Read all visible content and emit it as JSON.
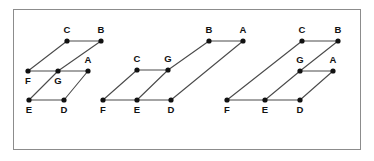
{
  "figure": {
    "domain": "Diagram",
    "canvas": {
      "width": 374,
      "height": 161,
      "background": "#ffffff"
    },
    "frame": {
      "x": 13,
      "y": 9,
      "width": 348,
      "height": 141,
      "stroke": "#8c8c8c",
      "stroke_width": 1
    },
    "style": {
      "edge_color": "#4a4a4a",
      "edge_width": 1.1,
      "node_color": "#111111",
      "node_radius": 2.6,
      "label_color": "#111111",
      "label_size": 9.5
    }
  },
  "graphs": [
    {
      "id": "graph-1",
      "name": "left-graph",
      "nodes": [
        {
          "id": "C",
          "label": "C",
          "x": 67,
          "y": 41,
          "lx": 67,
          "ly": 33
        },
        {
          "id": "B",
          "label": "B",
          "x": 101,
          "y": 41,
          "lx": 101,
          "ly": 33
        },
        {
          "id": "F",
          "label": "F",
          "x": 28,
          "y": 71,
          "lx": 28,
          "ly": 84
        },
        {
          "id": "G",
          "label": "G",
          "x": 58,
          "y": 71,
          "lx": 58,
          "ly": 84
        },
        {
          "id": "A",
          "label": "A",
          "x": 88,
          "y": 71,
          "lx": 88,
          "ly": 63
        },
        {
          "id": "E",
          "label": "E",
          "x": 29,
          "y": 100,
          "lx": 29,
          "ly": 113
        },
        {
          "id": "D",
          "label": "D",
          "x": 64,
          "y": 100,
          "lx": 64,
          "ly": 113
        }
      ],
      "edges": [
        {
          "from": "C",
          "to": "B"
        },
        {
          "from": "F",
          "to": "G"
        },
        {
          "from": "G",
          "to": "A"
        },
        {
          "from": "E",
          "to": "D"
        },
        {
          "from": "F",
          "to": "C"
        },
        {
          "from": "G",
          "to": "B"
        },
        {
          "from": "E",
          "to": "G"
        },
        {
          "from": "D",
          "to": "A"
        }
      ]
    },
    {
      "id": "graph-2",
      "name": "middle-graph",
      "nodes": [
        {
          "id": "B",
          "label": "B",
          "x": 209,
          "y": 41,
          "lx": 209,
          "ly": 33
        },
        {
          "id": "A",
          "label": "A",
          "x": 243,
          "y": 41,
          "lx": 243,
          "ly": 33
        },
        {
          "id": "C",
          "label": "C",
          "x": 137,
          "y": 70,
          "lx": 137,
          "ly": 62
        },
        {
          "id": "G",
          "label": "G",
          "x": 168,
          "y": 70,
          "lx": 168,
          "ly": 62
        },
        {
          "id": "F",
          "label": "F",
          "x": 103,
          "y": 100,
          "lx": 103,
          "ly": 113
        },
        {
          "id": "E",
          "label": "E",
          "x": 137,
          "y": 100,
          "lx": 137,
          "ly": 113
        },
        {
          "id": "D",
          "label": "D",
          "x": 171,
          "y": 100,
          "lx": 171,
          "ly": 113
        }
      ],
      "edges": [
        {
          "from": "B",
          "to": "A"
        },
        {
          "from": "C",
          "to": "G"
        },
        {
          "from": "F",
          "to": "E"
        },
        {
          "from": "E",
          "to": "D"
        },
        {
          "from": "F",
          "to": "C"
        },
        {
          "from": "E",
          "to": "G"
        },
        {
          "from": "G",
          "to": "B"
        },
        {
          "from": "D",
          "to": "A"
        }
      ]
    },
    {
      "id": "graph-3",
      "name": "right-graph",
      "nodes": [
        {
          "id": "C",
          "label": "C",
          "x": 302,
          "y": 41,
          "lx": 302,
          "ly": 33
        },
        {
          "id": "B",
          "label": "B",
          "x": 338,
          "y": 41,
          "lx": 338,
          "ly": 33
        },
        {
          "id": "G",
          "label": "G",
          "x": 300,
          "y": 71,
          "lx": 300,
          "ly": 63
        },
        {
          "id": "A",
          "label": "A",
          "x": 333,
          "y": 71,
          "lx": 333,
          "ly": 63
        },
        {
          "id": "F",
          "label": "F",
          "x": 227,
          "y": 100,
          "lx": 227,
          "ly": 113
        },
        {
          "id": "E",
          "label": "E",
          "x": 265,
          "y": 100,
          "lx": 265,
          "ly": 113
        },
        {
          "id": "D",
          "label": "D",
          "x": 300,
          "y": 100,
          "lx": 300,
          "ly": 113
        }
      ],
      "edges": [
        {
          "from": "C",
          "to": "B"
        },
        {
          "from": "G",
          "to": "A"
        },
        {
          "from": "F",
          "to": "E"
        },
        {
          "from": "E",
          "to": "D"
        },
        {
          "from": "F",
          "to": "C"
        },
        {
          "from": "E",
          "to": "G"
        },
        {
          "from": "G",
          "to": "B"
        },
        {
          "from": "D",
          "to": "A"
        }
      ]
    }
  ]
}
